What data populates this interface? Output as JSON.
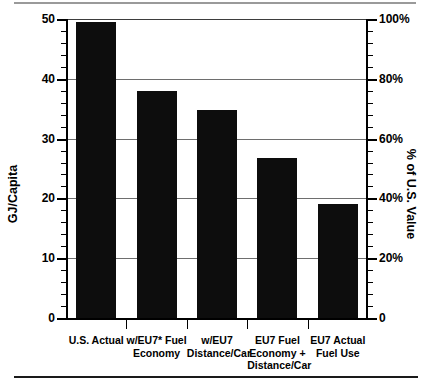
{
  "chart_data": {
    "type": "bar",
    "title": "",
    "xlabel": "",
    "ylabel": "GJ/Capita",
    "y2label": "% of U.S. Value",
    "categories": [
      "U.S. Actual",
      "w/EU7* Fuel\nEconomy",
      "w/EU7\nDistance/Car",
      "EU7 Fuel\nEconomy +\nDistance/Car",
      "EU7 Actual\nFuel Use"
    ],
    "values": [
      49.5,
      38.0,
      34.8,
      26.7,
      19.0
    ],
    "values_percent": [
      99,
      76,
      69.6,
      53.4,
      38
    ],
    "ylim": [
      0,
      50
    ],
    "y2lim": [
      0,
      100
    ],
    "yticks": [
      0,
      10,
      20,
      30,
      40,
      50
    ],
    "ytick_labels": [
      "0",
      "10",
      "20",
      "30",
      "40",
      "50"
    ],
    "y2ticks": [
      0,
      20,
      40,
      60,
      80,
      100
    ],
    "y2tick_labels": [
      "0",
      "20%",
      "40%",
      "60%",
      "80%",
      "100%"
    ],
    "y_minor_step": 2,
    "grid": true,
    "legend": null,
    "bar_color": "#0d0d0d",
    "grid_color": "#6e6e6e",
    "axis_color": "#000000"
  }
}
